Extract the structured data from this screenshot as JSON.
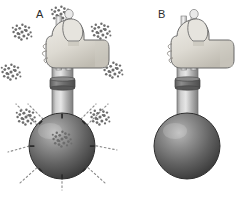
{
  "figure": {
    "title": "",
    "background_color": "#ffffff",
    "width": 249,
    "height": 221
  },
  "panels": [
    {
      "id": "panel-a",
      "label": "A",
      "description": "Hand pressing plunger of a round-bottom flask sprayer; particle clusters eject radially from the sphere along dashed motion trails",
      "emitting": true,
      "particle_cluster_count": 7,
      "pore_mark_count": 8
    },
    {
      "id": "panel-b",
      "label": "B",
      "description": "Hand pressing plunger of a round-bottom flask sprayer; no particles emitted, sphere surface smooth",
      "emitting": false,
      "particle_cluster_count": 0,
      "pore_mark_count": 0
    }
  ],
  "colors": {
    "background": "#ffffff",
    "sphere_dark": "#4a4a4a",
    "sphere_mid": "#6f6f6f",
    "sphere_highlight": "#b9b9b9",
    "sphere_outline": "#2e2e2e",
    "tube_light": "#d8d8d8",
    "tube_mid": "#a9a9a9",
    "tube_dark": "#7a7a7a",
    "collar": "#6b6b6b",
    "hand_fill": "#dedbd4",
    "hand_shade": "#b9b5ac",
    "hand_outline": "#6b6b6b",
    "particle": "#6d6d6d",
    "trail": "#8a8a8a",
    "label_text": "#2b2b2b"
  },
  "particle_clusters": [
    {
      "id": "cluster-up",
      "angle_deg": 270,
      "cx": 61,
      "cy": 14
    },
    {
      "id": "cluster-upper-left",
      "angle_deg": 225,
      "cx": 22,
      "cy": 32
    },
    {
      "id": "cluster-upper-right",
      "angle_deg": 315,
      "cx": 101,
      "cy": 31
    },
    {
      "id": "cluster-left",
      "angle_deg": 180,
      "cx": 11,
      "cy": 72
    },
    {
      "id": "cluster-right",
      "angle_deg": 0,
      "cx": 113,
      "cy": 70
    },
    {
      "id": "cluster-lower-left",
      "angle_deg": 135,
      "cx": 26,
      "cy": 117
    },
    {
      "id": "cluster-lower-right",
      "angle_deg": 45,
      "cx": 100,
      "cy": 117
    },
    {
      "id": "cluster-down",
      "angle_deg": 90,
      "cx": 62,
      "cy": 139
    }
  ]
}
